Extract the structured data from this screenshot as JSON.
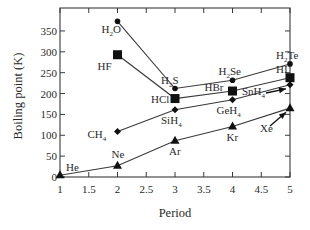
{
  "chart_data": {
    "type": "line",
    "title": "",
    "xlabel": "Period",
    "ylabel": "Boiling point (K)",
    "xlim": [
      1,
      5
    ],
    "ylim": [
      0,
      400
    ],
    "xticks": [
      1,
      1.5,
      2,
      2.5,
      3,
      3.5,
      4,
      4.5,
      5
    ],
    "xtick_labels": [
      "1",
      "1.5",
      "2",
      "2.5",
      "3",
      "3.5",
      "4",
      "4.5",
      "5"
    ],
    "yticks": [
      0,
      50,
      100,
      150,
      200,
      250,
      300,
      350
    ],
    "ytick_labels": [
      "0",
      "50",
      "100",
      "150",
      "200",
      "250",
      "300",
      "350"
    ],
    "grid": false,
    "legend": "none (inline point labels)",
    "series": [
      {
        "name": "Group 16 hydrides",
        "marker": "circle",
        "x": [
          2,
          3,
          4,
          5
        ],
        "values": [
          373,
          212,
          232,
          271
        ],
        "labels": [
          {
            "base": "H",
            "sub": "2",
            "tail": "O"
          },
          {
            "base": "H",
            "sub": "2",
            "tail": "S"
          },
          {
            "base": "H",
            "sub": "2",
            "tail": "Se"
          },
          {
            "base": "H",
            "sub": "2",
            "tail": "Te"
          }
        ]
      },
      {
        "name": "Group 17 hydrides",
        "marker": "square",
        "x": [
          2,
          3,
          4,
          5
        ],
        "values": [
          293,
          188,
          206,
          238
        ],
        "labels": [
          {
            "base": "HF",
            "sub": "",
            "tail": ""
          },
          {
            "base": "HCl",
            "sub": "",
            "tail": ""
          },
          {
            "base": "HBr",
            "sub": "",
            "tail": ""
          },
          {
            "base": "HI",
            "sub": "",
            "tail": ""
          }
        ]
      },
      {
        "name": "Group 14 hydrides",
        "marker": "diamond",
        "x": [
          2,
          3,
          4,
          5
        ],
        "values": [
          109,
          161,
          185,
          221
        ],
        "labels": [
          {
            "base": "CH",
            "sub": "4",
            "tail": ""
          },
          {
            "base": "SiH",
            "sub": "4",
            "tail": ""
          },
          {
            "base": "GeH",
            "sub": "4",
            "tail": ""
          },
          {
            "base": "SnH",
            "sub": "4",
            "tail": ""
          }
        ]
      },
      {
        "name": "Noble gases",
        "marker": "triangle",
        "x": [
          1,
          2,
          3,
          4,
          5
        ],
        "values": [
          4,
          27,
          87,
          121,
          165
        ],
        "labels": [
          {
            "base": "He",
            "sub": "",
            "tail": ""
          },
          {
            "base": "Ne",
            "sub": "",
            "tail": ""
          },
          {
            "base": "Ar",
            "sub": "",
            "tail": ""
          },
          {
            "base": "Kr",
            "sub": "",
            "tail": ""
          },
          {
            "base": "Xe",
            "sub": "",
            "tail": ""
          }
        ]
      }
    ],
    "annotations": [
      {
        "text": "SnH4",
        "arrow_to": [
          5,
          221
        ]
      },
      {
        "text": "Xe",
        "arrow_to": [
          5,
          165
        ]
      }
    ]
  },
  "layout_hints": {
    "label_offsets": [
      [
        [
          -16,
          12
        ],
        [
          -14,
          -5
        ],
        [
          -14,
          -5
        ],
        [
          -14,
          -5
        ]
      ],
      [
        [
          -20,
          15
        ],
        [
          -24,
          4
        ],
        [
          -28,
          0
        ],
        [
          -14,
          -5
        ]
      ],
      [
        [
          -30,
          6
        ],
        [
          -14,
          14
        ],
        [
          -16,
          14
        ],
        [
          -48,
          10
        ]
      ],
      [
        [
          6,
          -4
        ],
        [
          -6,
          -8
        ],
        [
          -6,
          14
        ],
        [
          -6,
          14
        ],
        [
          -30,
          24
        ]
      ]
    ]
  }
}
